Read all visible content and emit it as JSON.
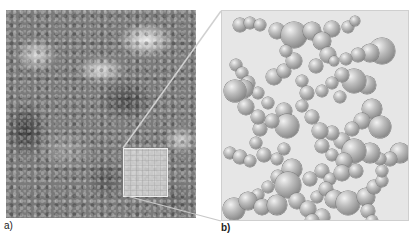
{
  "figure": {
    "panel_a": {
      "label": "a)",
      "description": "grayscale micrograph of porous aggregated material with highlighted zoom region"
    },
    "panel_b": {
      "label": "b)",
      "description": "3D model of connected spherical particles forming a network"
    }
  },
  "colors": {
    "background": "#ffffff",
    "panel_b_bg": "#e6e6e6",
    "connector_line": "#d0d0d0"
  },
  "balls": [
    [
      18,
      14,
      7
    ],
    [
      28,
      12,
      6
    ],
    [
      38,
      14,
      6
    ],
    [
      55,
      20,
      8
    ],
    [
      72,
      24,
      13
    ],
    [
      90,
      20,
      9
    ],
    [
      110,
      18,
      8
    ],
    [
      126,
      16,
      6
    ],
    [
      133,
      10,
      5
    ],
    [
      100,
      30,
      9
    ],
    [
      106,
      44,
      8
    ],
    [
      94,
      55,
      7
    ],
    [
      160,
      40,
      13
    ],
    [
      148,
      42,
      9
    ],
    [
      136,
      44,
      7
    ],
    [
      124,
      48,
      6
    ],
    [
      112,
      50,
      5
    ],
    [
      14,
      54,
      6
    ],
    [
      20,
      62,
      6
    ],
    [
      26,
      72,
      7
    ],
    [
      36,
      82,
      6
    ],
    [
      46,
      92,
      6
    ],
    [
      22,
      78,
      9
    ],
    [
      52,
      66,
      8
    ],
    [
      62,
      60,
      7
    ],
    [
      72,
      50,
      8
    ],
    [
      64,
      40,
      6
    ],
    [
      80,
      70,
      6
    ],
    [
      85,
      82,
      7
    ],
    [
      80,
      95,
      6
    ],
    [
      62,
      100,
      8
    ],
    [
      65,
      115,
      12
    ],
    [
      50,
      110,
      7
    ],
    [
      38,
      118,
      7
    ],
    [
      34,
      132,
      6
    ],
    [
      42,
      144,
      7
    ],
    [
      145,
      74,
      9
    ],
    [
      132,
      70,
      12
    ],
    [
      120,
      64,
      7
    ],
    [
      110,
      72,
      6
    ],
    [
      100,
      80,
      6
    ],
    [
      118,
      86,
      6
    ],
    [
      13,
      80,
      11
    ],
    [
      24,
      96,
      8
    ],
    [
      36,
      106,
      7
    ],
    [
      150,
      98,
      10
    ],
    [
      140,
      110,
      8
    ],
    [
      130,
      118,
      7
    ],
    [
      158,
      116,
      11
    ],
    [
      120,
      130,
      8
    ],
    [
      110,
      122,
      7
    ],
    [
      90,
      106,
      7
    ],
    [
      98,
      120,
      8
    ],
    [
      100,
      135,
      7
    ],
    [
      110,
      144,
      6
    ],
    [
      8,
      142,
      6
    ],
    [
      18,
      146,
      7
    ],
    [
      28,
      150,
      6
    ],
    [
      55,
      148,
      6
    ],
    [
      62,
      138,
      6
    ],
    [
      178,
      142,
      10
    ],
    [
      168,
      148,
      7
    ],
    [
      158,
      148,
      6
    ],
    [
      148,
      142,
      10
    ],
    [
      132,
      140,
      12
    ],
    [
      122,
      150,
      8
    ],
    [
      70,
      158,
      10
    ],
    [
      56,
      166,
      7
    ],
    [
      46,
      176,
      6
    ],
    [
      36,
      184,
      6
    ],
    [
      66,
      174,
      13
    ],
    [
      88,
      168,
      7
    ],
    [
      100,
      160,
      7
    ],
    [
      108,
      168,
      6
    ],
    [
      120,
      162,
      8
    ],
    [
      134,
      160,
      7
    ],
    [
      12,
      198,
      11
    ],
    [
      26,
      190,
      9
    ],
    [
      40,
      196,
      8
    ],
    [
      55,
      194,
      10
    ],
    [
      75,
      190,
      8
    ],
    [
      86,
      198,
      8
    ],
    [
      95,
      186,
      6
    ],
    [
      104,
      178,
      7
    ],
    [
      112,
      188,
      9
    ],
    [
      126,
      192,
      12
    ],
    [
      144,
      186,
      9
    ],
    [
      152,
      176,
      7
    ],
    [
      146,
      200,
      7
    ],
    [
      150,
      210,
      6
    ],
    [
      100,
      206,
      8
    ],
    [
      90,
      210,
      7
    ],
    [
      160,
      170,
      6
    ],
    [
      160,
      160,
      6
    ]
  ]
}
